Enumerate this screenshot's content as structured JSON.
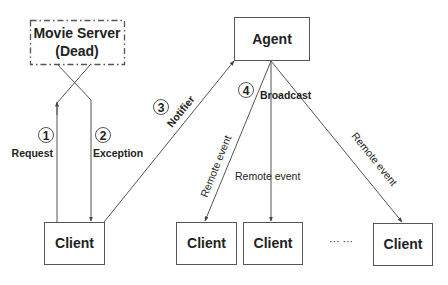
{
  "diagram": {
    "nodes": {
      "movie_server": {
        "line1": "Movie Server",
        "line2": "(Dead)"
      },
      "agent": {
        "label": "Agent"
      },
      "client_requester": {
        "label": "Client"
      },
      "client_a": {
        "label": "Client"
      },
      "client_b": {
        "label": "Client"
      },
      "client_c": {
        "label": "Client"
      },
      "ellipsis": {
        "label": "··· ···"
      }
    },
    "steps": [
      {
        "number": "1",
        "label": "Request"
      },
      {
        "number": "2",
        "label": "Exception"
      },
      {
        "number": "3",
        "label": "Notifier"
      },
      {
        "number": "4",
        "label": "Broadcast"
      }
    ],
    "remote_events": [
      {
        "label": "Remote event"
      },
      {
        "label": "Remote event"
      },
      {
        "label": "Remote event"
      }
    ],
    "colors": {
      "stroke": "#555555",
      "text": "#222222",
      "background": "#ffffff"
    }
  }
}
